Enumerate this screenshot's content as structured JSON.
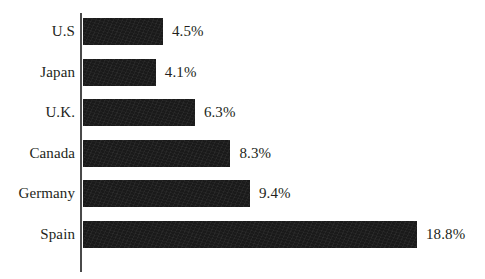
{
  "chart_data": {
    "type": "bar",
    "orientation": "horizontal",
    "title": "",
    "subtitle": "",
    "xlabel": "",
    "ylabel": "",
    "categories": [
      "U.S",
      "Japan",
      "U.K.",
      "Canada",
      "Germany",
      "Spain"
    ],
    "values": [
      4.5,
      4.1,
      6.3,
      8.3,
      9.4,
      18.8
    ],
    "value_labels": [
      "4.5%",
      "4.1%",
      "6.3%",
      "8.3%",
      "9.4%",
      "18.8%"
    ],
    "series": [
      {
        "name": "",
        "values": [
          4.5,
          4.1,
          6.3,
          8.3,
          9.4,
          18.8
        ]
      }
    ],
    "xlim": [
      0,
      18.8
    ],
    "grid": false,
    "legend": false,
    "legend_position": "none",
    "units": "percent",
    "bar_color": "#1a1a1a",
    "text_color": "#231f20",
    "axis_color": "#4a4a4a",
    "background_color": "#ffffff"
  },
  "chart": {
    "rows": [
      {
        "label": "U.S",
        "value_label": "4.5%",
        "value": 4.5
      },
      {
        "label": "Japan",
        "value_label": "4.1%",
        "value": 4.1
      },
      {
        "label": "U.K.",
        "value_label": "6.3%",
        "value": 6.3
      },
      {
        "label": "Canada",
        "value_label": "8.3%",
        "value": 8.3
      },
      {
        "label": "Germany",
        "value_label": "9.4%",
        "value": 9.4
      },
      {
        "label": "Spain",
        "value_label": "18.8%",
        "value": 18.8
      }
    ]
  }
}
